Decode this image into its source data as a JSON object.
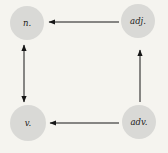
{
  "diagram": {
    "background": "#f5f4ef",
    "node_fill": "#d9d9d6",
    "arrow_color": "#161616",
    "nodes": [
      {
        "id": "noun",
        "label": "n.",
        "position": "top-left"
      },
      {
        "id": "adjective",
        "label": "adj.",
        "position": "top-right"
      },
      {
        "id": "verb",
        "label": "v.",
        "position": "bottom-left"
      },
      {
        "id": "adverb",
        "label": "adv.",
        "position": "bottom-right"
      }
    ],
    "edges": [
      {
        "from": "adjective",
        "to": "noun",
        "bidirectional": false,
        "orientation": "horizontal-top"
      },
      {
        "from": "noun",
        "to": "verb",
        "bidirectional": true,
        "orientation": "vertical-left"
      },
      {
        "from": "adverb",
        "to": "verb",
        "bidirectional": false,
        "orientation": "horizontal-bottom"
      },
      {
        "from": "adverb",
        "to": "adjective",
        "bidirectional": false,
        "orientation": "vertical-right"
      }
    ]
  }
}
